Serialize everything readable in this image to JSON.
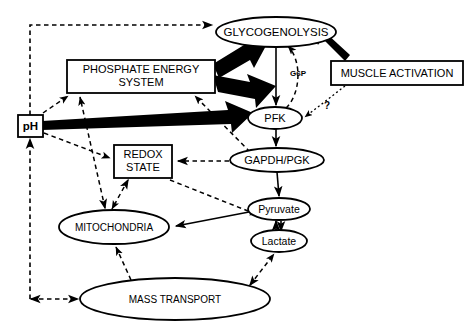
{
  "diagram": {
    "colors": {
      "stroke": "#000000",
      "fill": "#ffffff",
      "thick_arrow": "#000000"
    },
    "nodes": [
      {
        "id": "glycogenolysis",
        "label": "GLYCOGENOLYSIS",
        "shape": "ellipse",
        "cx": 276,
        "cy": 32,
        "rx": 60,
        "ry": 15,
        "font_size": 11.5
      },
      {
        "id": "phosphate_energy_system",
        "label_line1": "PHOSPHATE   ENERGY",
        "label_line2": "SYSTEM",
        "shape": "rect",
        "x": 67,
        "y": 60,
        "w": 148,
        "h": 33,
        "font_size": 11
      },
      {
        "id": "muscle_activation",
        "label": "MUSCLE ACTIVATION",
        "shape": "rect",
        "x": 331,
        "y": 61,
        "w": 132,
        "h": 24,
        "font_size": 11
      },
      {
        "id": "pfk",
        "label": "PFK",
        "shape": "ellipse",
        "cx": 275,
        "cy": 118,
        "rx": 27,
        "ry": 11,
        "font_size": 11
      },
      {
        "id": "ph",
        "label": "pH",
        "shape": "rect",
        "x": 18,
        "y": 115,
        "w": 25,
        "h": 22,
        "font_size": 11.5,
        "bold": true
      },
      {
        "id": "redox_state",
        "label_line1": "REDOX",
        "label_line2": "STATE",
        "shape": "rect",
        "x": 114,
        "y": 145,
        "w": 58,
        "h": 33,
        "font_size": 11
      },
      {
        "id": "gapdh_pgk",
        "label": "GAPDH/PGK",
        "shape": "ellipse",
        "cx": 277,
        "cy": 160,
        "rx": 47,
        "ry": 12,
        "font_size": 11
      },
      {
        "id": "mitochondria",
        "label": "MITOCHONDRIA",
        "shape": "ellipse",
        "cx": 114,
        "cy": 227,
        "rx": 55,
        "ry": 17,
        "font_size": 10
      },
      {
        "id": "pyruvate",
        "label": "Pyruvate",
        "shape": "ellipse",
        "cx": 279,
        "cy": 209,
        "rx": 31,
        "ry": 11,
        "font_size": 10.5
      },
      {
        "id": "lactate",
        "label": "Lactate",
        "shape": "ellipse",
        "cx": 279,
        "cy": 241,
        "rx": 28,
        "ry": 11,
        "font_size": 10.5
      },
      {
        "id": "mass_transport",
        "label": "MASS  TRANSPORT",
        "shape": "ellipse",
        "cx": 175,
        "cy": 299,
        "rx": 95,
        "ry": 21,
        "font_size": 10
      }
    ],
    "edge_labels": [
      {
        "id": "g6p",
        "text": "G6P",
        "x": 298,
        "y": 76,
        "font_size": 8
      },
      {
        "id": "question-mark",
        "text": "?",
        "x": 327,
        "y": 109,
        "font_size": 10
      }
    ],
    "edges": [
      {
        "id": "ph-to-glycogenolysis",
        "style": "dashed",
        "from": "ph",
        "to": "glycogenolysis"
      },
      {
        "id": "pes-to-glycogenolysis",
        "style": "thick",
        "from": "phosphate_energy_system",
        "to": "glycogenolysis"
      },
      {
        "id": "pes-to-pfk",
        "style": "thick",
        "from": "phosphate_energy_system",
        "to": "pfk"
      },
      {
        "id": "ph-to-pfk",
        "style": "thick",
        "from": "ph",
        "to": "pfk"
      },
      {
        "id": "muscle-activation-to-glycogenolysis",
        "style": "thick",
        "from": "muscle_activation",
        "to": "glycogenolysis"
      },
      {
        "id": "muscle-activation-to-pfk",
        "style": "dotted",
        "from": "muscle_activation",
        "to": "pfk"
      },
      {
        "id": "glycogenolysis-to-pfk-g6p",
        "style": "solid",
        "from": "glycogenolysis",
        "to": "pfk"
      },
      {
        "id": "pfk-to-glycogenolysis-feedback",
        "style": "dashed",
        "from": "pfk",
        "to": "glycogenolysis"
      },
      {
        "id": "pfk-to-gapdh",
        "style": "solid",
        "from": "pfk",
        "to": "gapdh_pgk"
      },
      {
        "id": "gapdh-to-pyruvate",
        "style": "solid",
        "from": "gapdh_pgk",
        "to": "pyruvate"
      },
      {
        "id": "pyruvate-lactate",
        "style": "solid-bidirectional",
        "from": "pyruvate",
        "to": "lactate"
      },
      {
        "id": "pyruvate-to-mitochondria",
        "style": "solid",
        "from": "pyruvate",
        "to": "mitochondria"
      },
      {
        "id": "gapdh-to-redox",
        "style": "dashed",
        "from": "gapdh_pgk",
        "to": "redox_state"
      },
      {
        "id": "gapdh-to-pes",
        "style": "dashed",
        "from": "gapdh_pgk",
        "to": "phosphate_energy_system"
      },
      {
        "id": "redox-to-mitochondria",
        "style": "dashed-bidirectional",
        "from": "redox_state",
        "to": "mitochondria"
      },
      {
        "id": "redox-to-pyruvate",
        "style": "dashed",
        "from": "redox_state",
        "to": "pyruvate"
      },
      {
        "id": "ph-to-redox",
        "style": "dashed",
        "from": "ph",
        "to": "redox_state"
      },
      {
        "id": "ph-to-pes",
        "style": "dashed",
        "from": "ph",
        "to": "phosphate_energy_system"
      },
      {
        "id": "mitochondria-to-pes",
        "style": "dashed-bidirectional",
        "from": "mitochondria",
        "to": "phosphate_energy_system"
      },
      {
        "id": "mass-transport-to-mitochondria",
        "style": "dashed",
        "from": "mass_transport",
        "to": "mitochondria"
      },
      {
        "id": "mass-transport-to-lactate",
        "style": "dashed-bidirectional",
        "from": "mass_transport",
        "to": "lactate"
      },
      {
        "id": "mass-transport-to-ph",
        "style": "dashed-bidirectional",
        "from": "mass_transport",
        "to": "ph"
      }
    ]
  }
}
